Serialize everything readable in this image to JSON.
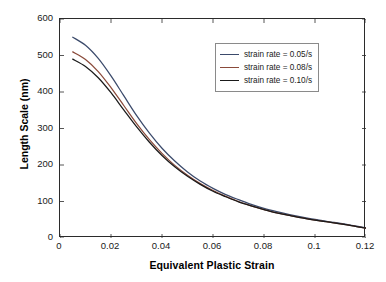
{
  "chart_data": {
    "type": "line",
    "title": "",
    "xlabel": "Equivalent Plastic Strain",
    "ylabel": "Length Scale (nm)",
    "xlim": [
      0,
      0.12
    ],
    "ylim": [
      0,
      600
    ],
    "xticks": [
      "0",
      "0.02",
      "0.04",
      "0.06",
      "0.08",
      "0.1",
      "0.12"
    ],
    "xtick_values": [
      0,
      0.02,
      0.04,
      0.06,
      0.08,
      0.1,
      0.12
    ],
    "yticks": [
      "0",
      "100",
      "200",
      "300",
      "400",
      "500",
      "600"
    ],
    "ytick_values": [
      0,
      100,
      200,
      300,
      400,
      500,
      600
    ],
    "grid": false,
    "legend_position": "upper right",
    "x": [
      0.005,
      0.01,
      0.015,
      0.02,
      0.025,
      0.03,
      0.035,
      0.04,
      0.045,
      0.05,
      0.055,
      0.06,
      0.065,
      0.07,
      0.075,
      0.08,
      0.085,
      0.09,
      0.095,
      0.1,
      0.105,
      0.11,
      0.115,
      0.12
    ],
    "series": [
      {
        "name": "strain rate = 0.05/s",
        "color": "#3b4a6b",
        "values": [
          550,
          528,
          492,
          444,
          390,
          336,
          288,
          246,
          211,
          181,
          156,
          136,
          119,
          105,
          92,
          81,
          72,
          64,
          57,
          51,
          45,
          40,
          34,
          28
        ]
      },
      {
        "name": "strain rate = 0.08/s",
        "color": "#8a4a3a",
        "values": [
          510,
          489,
          456,
          412,
          363,
          314,
          270,
          232,
          199,
          172,
          149,
          130,
          114,
          100,
          88,
          78,
          69,
          62,
          55,
          49,
          44,
          39,
          33,
          27
        ]
      },
      {
        "name": "strain rate = 0.10/s",
        "color": "#1a1a1a",
        "values": [
          490,
          470,
          439,
          398,
          351,
          305,
          263,
          226,
          195,
          169,
          147,
          128,
          113,
          99,
          88,
          78,
          69,
          62,
          55,
          49,
          44,
          39,
          33,
          27
        ]
      }
    ]
  }
}
